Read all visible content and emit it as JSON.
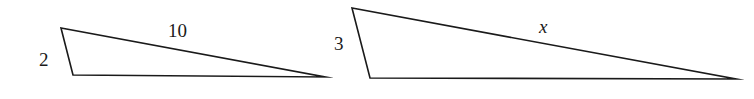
{
  "figure": {
    "background_color": "#ffffff",
    "stroke_color": "#1a1a1a",
    "triangles": [
      {
        "name": "left-triangle",
        "points": "61,28 73,75 325,77",
        "labels": {
          "short_side": "2",
          "hypotenuse": "10"
        }
      },
      {
        "name": "right-triangle",
        "points": "352,8 370,78 736,79",
        "labels": {
          "short_side": "3",
          "hypotenuse": "x"
        }
      }
    ]
  }
}
